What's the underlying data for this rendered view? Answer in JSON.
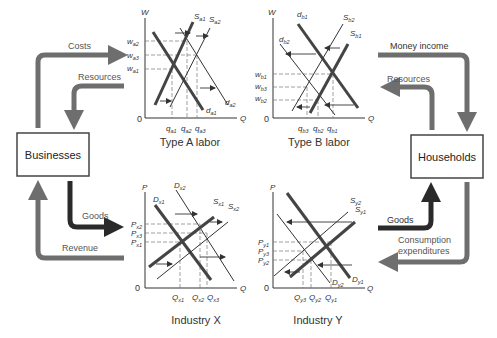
{
  "sectors": {
    "businesses": "Businesses",
    "households": "Households"
  },
  "flows": {
    "costs": "Costs",
    "resources_left": "Resources",
    "money_income": "Money income",
    "resources_right": "Resources",
    "goods_left": "Goods",
    "revenue": "Revenue",
    "goods_right": "Goods",
    "consumption_1": "Consumption",
    "consumption_2": "expenditures"
  },
  "charts": {
    "type_a": {
      "title": "Type A labor",
      "y_axis": "W",
      "x_axis": "Q",
      "origin": "0",
      "y_ticks": [
        {
          "base": "w",
          "sub": "a2"
        },
        {
          "base": "w",
          "sub": "a3"
        },
        {
          "base": "w",
          "sub": "a1"
        }
      ],
      "x_ticks": [
        {
          "base": "q",
          "sub": "a1"
        },
        {
          "base": "q",
          "sub": "a2"
        },
        {
          "base": "q",
          "sub": "a3"
        }
      ],
      "curves": [
        {
          "base": "S",
          "sub": "a1"
        },
        {
          "base": "S",
          "sub": "a2"
        },
        {
          "base": "d",
          "sub": "a1"
        },
        {
          "base": "d",
          "sub": "a2"
        }
      ]
    },
    "type_b": {
      "title": "Type B labor",
      "y_axis": "W",
      "x_axis": "Q",
      "origin": "0",
      "y_ticks": [
        {
          "base": "w",
          "sub": "b1"
        },
        {
          "base": "w",
          "sub": "b3"
        },
        {
          "base": "w",
          "sub": "b2"
        }
      ],
      "x_ticks": [
        {
          "base": "q",
          "sub": "b3"
        },
        {
          "base": "q",
          "sub": "b2"
        },
        {
          "base": "q",
          "sub": "b1"
        }
      ],
      "curves": [
        {
          "base": "d",
          "sub": "b1"
        },
        {
          "base": "d",
          "sub": "b2"
        },
        {
          "base": "S",
          "sub": "b2"
        },
        {
          "base": "S",
          "sub": "b1"
        }
      ]
    },
    "industry_x": {
      "title": "Industry X",
      "y_axis": "P",
      "x_axis": "Q",
      "origin": "0",
      "y_ticks": [
        {
          "base": "P",
          "sub": "x2"
        },
        {
          "base": "P",
          "sub": "x3"
        },
        {
          "base": "P",
          "sub": "x1"
        }
      ],
      "x_ticks": [
        {
          "base": "Q",
          "sub": "x1"
        },
        {
          "base": "Q",
          "sub": "x2"
        },
        {
          "base": "Q",
          "sub": "x3"
        }
      ],
      "curves": [
        {
          "base": "D",
          "sub": "x1"
        },
        {
          "base": "D",
          "sub": "x2"
        },
        {
          "base": "S",
          "sub": "x1"
        },
        {
          "base": "S",
          "sub": "x2"
        }
      ]
    },
    "industry_y": {
      "title": "Industry Y",
      "y_axis": "P",
      "x_axis": "Q",
      "origin": "0",
      "y_ticks": [
        {
          "base": "P",
          "sub": "y1"
        },
        {
          "base": "P",
          "sub": "y3"
        },
        {
          "base": "P",
          "sub": "y2"
        }
      ],
      "x_ticks": [
        {
          "base": "Q",
          "sub": "y3"
        },
        {
          "base": "Q",
          "sub": "y2"
        },
        {
          "base": "Q",
          "sub": "y1"
        }
      ],
      "curves": [
        {
          "base": "S",
          "sub": "y2"
        },
        {
          "base": "S",
          "sub": "y1"
        },
        {
          "base": "D",
          "sub": "y2"
        },
        {
          "base": "D",
          "sub": "y1"
        }
      ]
    }
  },
  "colors": {
    "money_flow": "#6e6e6e",
    "real_flow": "#2a2a2a",
    "curve_bold": "#444444",
    "curve_thin": "#333333",
    "guide": "#777777"
  }
}
